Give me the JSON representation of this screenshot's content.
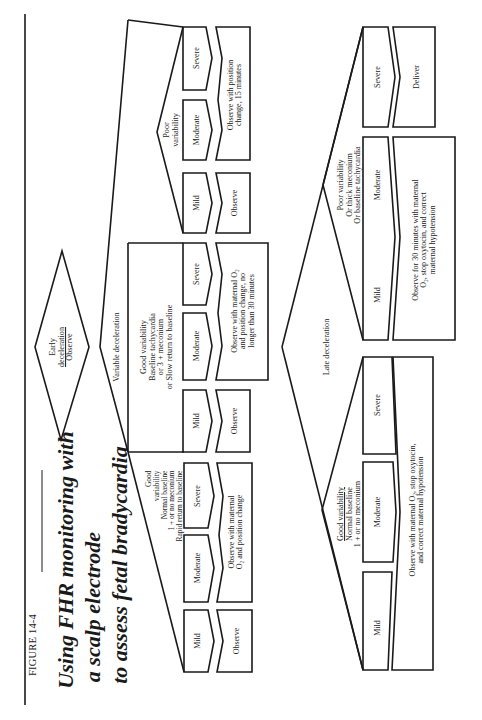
{
  "figure": {
    "label": "FIGURE 14-4",
    "title_lines": [
      "Using FHR monitoring with",
      "a scalp electrode",
      "to assess fetal bradycardia"
    ]
  },
  "early": {
    "line1": "Early",
    "line2": "deceleration",
    "line3": "Observe"
  },
  "variable": {
    "label": "Variable deceleration",
    "good_normal": {
      "criteria": [
        "Good",
        "variability",
        "Normal baseline",
        "1 +  or no meconium",
        "Rapid return to baseline"
      ],
      "severity": [
        "Mild",
        "Moderate",
        "Severe"
      ],
      "actions": [
        "Observe",
        "Observe with maternal",
        "O₂ and position change"
      ]
    },
    "good_tachy": {
      "criteria": [
        "Good variability",
        "Baseline tachycardia",
        "or    3 +  meconium",
        "or   Slow return to baseline"
      ],
      "severity": [
        "Mild",
        "Moderate",
        "Severe"
      ],
      "actions": [
        "Observe",
        "Observe with maternal O₂",
        "and position change, no",
        "longer than 30 minutes"
      ]
    },
    "poor": {
      "criteria": [
        "Poor",
        "variability"
      ],
      "severity": [
        "Mild",
        "Moderate",
        "Severe"
      ],
      "actions": [
        "Observe",
        "Observe with position",
        "change, 15 minutes"
      ]
    }
  },
  "late": {
    "label": "Late deceleration",
    "good": {
      "criteria": [
        "Good variability",
        "Normal baseline",
        "1 +  or no meconium"
      ],
      "severity": [
        "Mild",
        "Moderate",
        "Severe"
      ],
      "actions": [
        "Observe with maternal O₂, stop oxytocin,",
        "and correct maternal hypotension"
      ]
    },
    "poor": {
      "criteria": [
        "Poor  variability",
        "Or thick meconium",
        "Or baseline tachycardia"
      ],
      "severity": [
        "Mild",
        "Moderate",
        "Severe"
      ],
      "actions": [
        "Observe for 30 minutes with maternal",
        "O₂, stop oxytocin, and correct",
        "maternal hypotension",
        "Deliver"
      ]
    }
  }
}
